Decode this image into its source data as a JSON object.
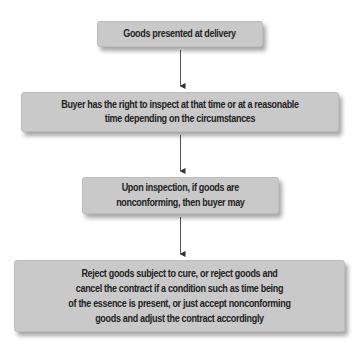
{
  "diagram": {
    "type": "flowchart",
    "direction": "top-to-bottom",
    "colors": {
      "box_fill": "#c9c9c9",
      "text": "#222222",
      "arrow": "#444444",
      "background": "#ffffff"
    },
    "nodes": [
      {
        "id": "n1",
        "label": "Goods presented at delivery"
      },
      {
        "id": "n2",
        "label": "Buyer has the right to inspect at that time or at a reasonable\ntime depending on the circumstances"
      },
      {
        "id": "n3",
        "label": "Upon inspection, if goods are\nnonconforming, then buyer may"
      },
      {
        "id": "n4",
        "label": "Reject goods subject to cure, or reject goods and\ncancel the contract if a condition such as time being\nof the essence is present, or just accept nonconforming\ngoods and adjust the contract accordingly"
      }
    ],
    "edges": [
      {
        "from": "n1",
        "to": "n2"
      },
      {
        "from": "n2",
        "to": "n3"
      },
      {
        "from": "n3",
        "to": "n4"
      }
    ]
  }
}
